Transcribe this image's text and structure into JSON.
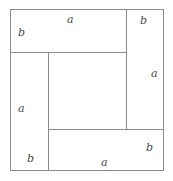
{
  "figure": {
    "stroke_color": "#8a8a8a",
    "background_color": "#ffffff",
    "label_color": "#4a4a4a",
    "outer_square": {
      "x": 10,
      "y": 9,
      "width": 153,
      "height": 161
    },
    "cuts": [
      {
        "name": "top-horizontal-cut",
        "orientation": "horizontal",
        "y": 52,
        "x1": 10,
        "x2": 126
      },
      {
        "name": "right-vertical-cut",
        "orientation": "vertical",
        "x": 126,
        "y1": 9,
        "y2": 129
      },
      {
        "name": "bottom-horizontal-cut",
        "orientation": "horizontal",
        "y": 129,
        "x1": 48,
        "x2": 163
      },
      {
        "name": "left-vertical-cut",
        "orientation": "vertical",
        "x": 48,
        "y1": 52,
        "y2": 170
      }
    ],
    "labels": {
      "top_rect_short_side": "b",
      "top_rect_long_side": "a",
      "top_right_short_side": "b",
      "right_rect_long_side": "a",
      "left_rect_long_side": "a",
      "bottom_left_short_side": "b",
      "bottom_rect_long_side": "a",
      "bottom_right_short_side": "b"
    }
  }
}
